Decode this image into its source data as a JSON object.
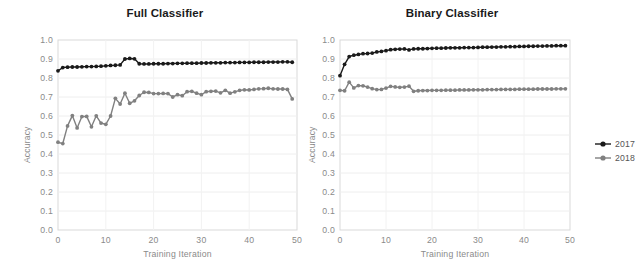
{
  "figure": {
    "width": 641,
    "height": 278,
    "background": "#ffffff"
  },
  "legend": {
    "position": "right",
    "entries": [
      {
        "label": "2017",
        "color": "#1a1a1a",
        "marker": "circle"
      },
      {
        "label": "2018",
        "color": "#808080",
        "marker": "circle"
      }
    ]
  },
  "chart_data": [
    {
      "type": "line",
      "title": "Full Classifier",
      "xlabel": "Training Iteration",
      "ylabel": "Accuracy",
      "xlim": [
        0,
        50
      ],
      "ylim": [
        0.0,
        1.0
      ],
      "xticks": [
        0,
        10,
        20,
        30,
        40,
        50
      ],
      "yticks": [
        "0.0",
        "0.1",
        "0.2",
        "0.3",
        "0.4",
        "0.5",
        "0.6",
        "0.7",
        "0.8",
        "0.9",
        "1.0"
      ],
      "grid": true,
      "legend_position": "right",
      "x": [
        0,
        1,
        2,
        3,
        4,
        5,
        6,
        7,
        8,
        9,
        10,
        11,
        12,
        13,
        14,
        15,
        16,
        17,
        18,
        19,
        20,
        21,
        22,
        23,
        24,
        25,
        26,
        27,
        28,
        29,
        30,
        31,
        32,
        33,
        34,
        35,
        36,
        37,
        38,
        39,
        40,
        41,
        42,
        43,
        44,
        45,
        46,
        47,
        48,
        49
      ],
      "series": [
        {
          "name": "2017",
          "color": "#1a1a1a",
          "values": [
            0.838,
            0.855,
            0.857,
            0.858,
            0.858,
            0.859,
            0.86,
            0.86,
            0.861,
            0.862,
            0.864,
            0.866,
            0.867,
            0.869,
            0.9,
            0.903,
            0.901,
            0.875,
            0.874,
            0.874,
            0.875,
            0.875,
            0.875,
            0.876,
            0.876,
            0.877,
            0.877,
            0.878,
            0.878,
            0.878,
            0.879,
            0.879,
            0.88,
            0.88,
            0.88,
            0.881,
            0.881,
            0.881,
            0.882,
            0.882,
            0.882,
            0.883,
            0.883,
            0.883,
            0.884,
            0.884,
            0.884,
            0.885,
            0.885,
            0.883
          ]
        },
        {
          "name": "2018",
          "color": "#808080",
          "values": [
            0.462,
            0.455,
            0.548,
            0.602,
            0.537,
            0.597,
            0.598,
            0.543,
            0.601,
            0.563,
            0.556,
            0.6,
            0.693,
            0.663,
            0.72,
            0.667,
            0.68,
            0.708,
            0.725,
            0.724,
            0.718,
            0.718,
            0.719,
            0.718,
            0.7,
            0.712,
            0.707,
            0.728,
            0.73,
            0.72,
            0.712,
            0.728,
            0.73,
            0.731,
            0.722,
            0.735,
            0.72,
            0.727,
            0.735,
            0.738,
            0.737,
            0.74,
            0.743,
            0.744,
            0.746,
            0.743,
            0.742,
            0.742,
            0.74,
            0.69
          ]
        }
      ]
    },
    {
      "type": "line",
      "title": "Binary Classifier",
      "xlabel": "Training Iteration",
      "ylabel": "Accuracy",
      "xlim": [
        0,
        50
      ],
      "ylim": [
        0.0,
        1.0
      ],
      "xticks": [
        0,
        10,
        20,
        30,
        40,
        50
      ],
      "yticks": [
        "0.0",
        "0.1",
        "0.2",
        "0.3",
        "0.4",
        "0.5",
        "0.6",
        "0.7",
        "0.8",
        "0.9",
        "1.0"
      ],
      "grid": true,
      "legend_position": "right",
      "x": [
        0,
        1,
        2,
        3,
        4,
        5,
        6,
        7,
        8,
        9,
        10,
        11,
        12,
        13,
        14,
        15,
        16,
        17,
        18,
        19,
        20,
        21,
        22,
        23,
        24,
        25,
        26,
        27,
        28,
        29,
        30,
        31,
        32,
        33,
        34,
        35,
        36,
        37,
        38,
        39,
        40,
        41,
        42,
        43,
        44,
        45,
        46,
        47,
        48,
        49
      ],
      "series": [
        {
          "name": "2017",
          "color": "#1a1a1a",
          "values": [
            0.812,
            0.872,
            0.913,
            0.92,
            0.924,
            0.928,
            0.929,
            0.931,
            0.937,
            0.94,
            0.944,
            0.949,
            0.951,
            0.952,
            0.953,
            0.948,
            0.953,
            0.954,
            0.954,
            0.955,
            0.956,
            0.957,
            0.957,
            0.958,
            0.959,
            0.959,
            0.959,
            0.96,
            0.96,
            0.96,
            0.961,
            0.962,
            0.962,
            0.963,
            0.963,
            0.964,
            0.964,
            0.965,
            0.965,
            0.966,
            0.966,
            0.967,
            0.967,
            0.968,
            0.968,
            0.969,
            0.969,
            0.97,
            0.97,
            0.97
          ]
        },
        {
          "name": "2018",
          "color": "#808080",
          "values": [
            0.735,
            0.733,
            0.778,
            0.748,
            0.76,
            0.759,
            0.752,
            0.744,
            0.739,
            0.74,
            0.747,
            0.756,
            0.753,
            0.751,
            0.752,
            0.757,
            0.73,
            0.733,
            0.734,
            0.734,
            0.735,
            0.735,
            0.735,
            0.736,
            0.736,
            0.736,
            0.737,
            0.737,
            0.737,
            0.738,
            0.738,
            0.738,
            0.739,
            0.739,
            0.739,
            0.74,
            0.74,
            0.74,
            0.74,
            0.741,
            0.741,
            0.741,
            0.741,
            0.742,
            0.742,
            0.742,
            0.742,
            0.743,
            0.743,
            0.743
          ]
        }
      ]
    }
  ]
}
